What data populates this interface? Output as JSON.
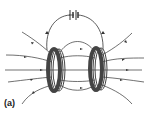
{
  "figure": {
    "label": "(a)",
    "colors": {
      "line": "#333333",
      "coil": "#444444",
      "background": "#ffffff"
    }
  }
}
